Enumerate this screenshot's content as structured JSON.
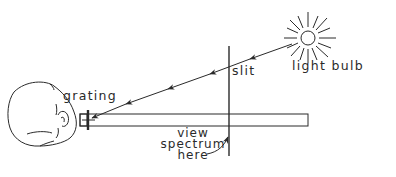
{
  "diagram": {
    "type": "optics-setup",
    "colors": {
      "stroke": "#2a2a2a",
      "background": "#ffffff"
    },
    "labels": {
      "light_source": "light bulb",
      "slit": "slit",
      "grating": "grating",
      "view_line1": "view",
      "view_line2": "spectrum",
      "view_line3": "here"
    },
    "components": [
      {
        "name": "light-bulb",
        "icon": "sun-bulb-icon"
      },
      {
        "name": "slit",
        "icon": "vertical-line"
      },
      {
        "name": "viewing-tube",
        "icon": "rectangle"
      },
      {
        "name": "diffraction-grating",
        "icon": "cross-bars"
      },
      {
        "name": "observer-head",
        "icon": "head-top-view-icon"
      }
    ]
  }
}
